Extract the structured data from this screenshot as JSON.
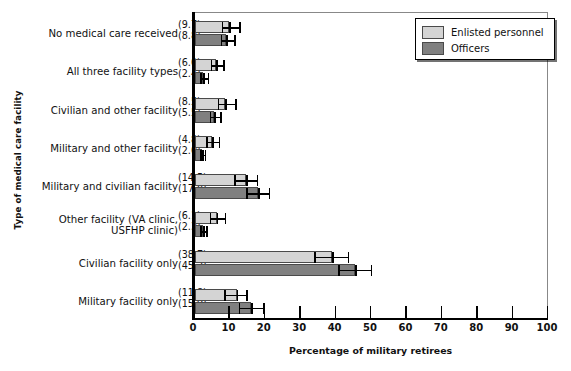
{
  "chart_data": {
    "type": "bar",
    "orientation": "horizontal",
    "title": "",
    "xlabel": "Percentage of military retirees",
    "ylabel": "Type of medical care facility",
    "xlim": [
      0,
      100
    ],
    "xticks": [
      0,
      10,
      20,
      30,
      40,
      50,
      60,
      70,
      80,
      90,
      100
    ],
    "grid": false,
    "legend_position": "top-right",
    "categories": [
      "No medical care received",
      "All three facility types",
      "Civilian and other facility",
      "Military and other facility",
      "Military and civilian facility",
      "Other facility (VA clinic,\nUSFHP clinic)",
      "Civilian facility only",
      "Military facility only"
    ],
    "series": [
      {
        "name": "Enlisted personnel",
        "color": "#d4d4d4",
        "values": [
          9.7,
          6.0,
          8.5,
          4.8,
          14.5,
          6.1,
          38.7,
          11.8
        ],
        "errors_low": [
          7.6,
          4.4,
          6.4,
          3.2,
          11.0,
          4.1,
          33.7,
          8.3
        ],
        "errors_high": [
          12.9,
          8.4,
          11.8,
          7.2,
          17.9,
          8.9,
          43.6,
          15.0
        ]
      },
      {
        "name": "Officers",
        "color": "#808080",
        "values": [
          8.8,
          2.4,
          5.5,
          2.0,
          17.8,
          2.3,
          45.2,
          15.9
        ],
        "errors_low": [
          7.3,
          1.5,
          4.1,
          1.4,
          14.4,
          1.5,
          40.4,
          12.4
        ],
        "errors_high": [
          11.5,
          4.0,
          7.5,
          3.2,
          21.3,
          3.6,
          50.1,
          19.7
        ]
      }
    ],
    "value_labels": {
      "enlisted": [
        "(9.7)",
        "(6.0)",
        "(8.5)",
        "(4.8)",
        "(14.5)",
        "(6.1)",
        "(38.7)",
        "(11.8)"
      ],
      "officers": [
        "(8.8)",
        "(2.4)",
        "(5.5)",
        "(2.0)",
        "(17.8)",
        "(2.3)",
        "(45.2)",
        "(15.9)"
      ]
    }
  },
  "legend": {
    "items": [
      {
        "label": "Enlisted personnel"
      },
      {
        "label": "Officers"
      }
    ]
  }
}
